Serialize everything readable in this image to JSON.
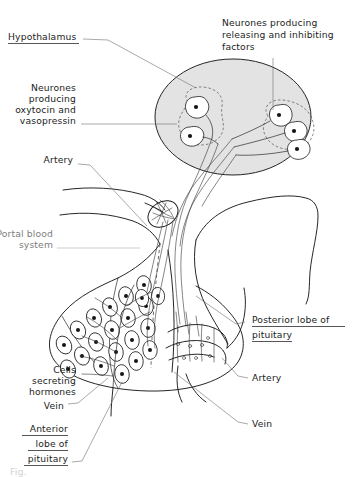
{
  "figure": {
    "background_color": "#ffffff",
    "ink_color": "#1a1a1a",
    "hypothalamus_fill": "#e3e3e3"
  },
  "labels": {
    "hypothalamus": "Hypothalamus",
    "neurones_releasing_1": "Neurones producing",
    "neurones_releasing_2": "releasing and inhibiting",
    "neurones_releasing_3": "factors",
    "neurones_oxytocin_1": "Neurones",
    "neurones_oxytocin_2": "producing",
    "neurones_oxytocin_3": "oxytocin and",
    "neurones_oxytocin_4": "vasopressin",
    "artery_left": "Artery",
    "portal_1": "Portal blood",
    "portal_2": "system",
    "posterior_1": "Posterior lobe of",
    "posterior_2": "pituitary",
    "artery_right": "Artery",
    "vein_right": "Vein",
    "cells_secreting_1": "Cells",
    "cells_secreting_2": "secreting",
    "cells_secreting_3": "hormones",
    "vein_left": "Vein",
    "anterior_1": "Anterior",
    "anterior_2": "lobe of",
    "anterior_3": "pituitary",
    "footer": "Fig."
  },
  "structures": {
    "hypothalamus_oval": "hypothalamus",
    "supraoptic_nucleus": "neurones producing oxytocin and vasopressin",
    "releasing_nucleus": "neurones producing releasing and inhibiting factors",
    "median_eminence": "portal blood system capillary plexus",
    "anterior_lobe": "anterior lobe of pituitary",
    "posterior_lobe": "posterior lobe of pituitary",
    "secretory_cells_count": 21,
    "left_neurone_count": 2,
    "right_neurone_count": 3
  }
}
